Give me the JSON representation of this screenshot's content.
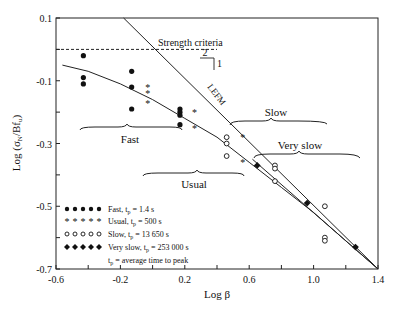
{
  "chart_data": {
    "type": "scatter",
    "title": "",
    "xlabel": "Log β",
    "ylabel": "Log (σN/Bfu)",
    "xlim": [
      -0.6,
      1.4
    ],
    "ylim": [
      -0.7,
      0.1
    ],
    "x_ticks": [
      -0.6,
      -0.2,
      0.2,
      0.6,
      1.0,
      1.4
    ],
    "x_tick_labels": [
      "-0.6",
      "-0.2",
      "0.2",
      "0.6",
      "1.0",
      "1.4"
    ],
    "x_minor_ticks": [
      -0.4,
      0.0,
      0.4,
      0.8,
      1.2
    ],
    "y_ticks": [
      0.1,
      -0.1,
      -0.3,
      -0.5,
      -0.7
    ],
    "y_tick_labels": [
      "0.1",
      "-0.1",
      "-0.3",
      "-0.5",
      "-0.7"
    ],
    "y_minor_ticks": [
      0.0,
      -0.2,
      -0.4,
      -0.6
    ],
    "grid": false,
    "legend_position": "lower left (inside)",
    "series": [
      {
        "name": "Fast, tp = 1.4 s",
        "marker": "filled-circle",
        "x": [
          -0.43,
          -0.43,
          -0.43,
          -0.13,
          -0.13,
          -0.13,
          0.17,
          0.17,
          0.17,
          0.17
        ],
        "y": [
          -0.02,
          -0.09,
          -0.11,
          -0.07,
          -0.12,
          -0.19,
          -0.19,
          -0.2,
          -0.21,
          -0.24
        ]
      },
      {
        "name": "Usual, tp = 500 s",
        "marker": "asterisk",
        "x": [
          -0.03,
          -0.03,
          -0.03,
          0.26,
          0.26,
          0.56,
          0.56
        ],
        "y": [
          -0.12,
          -0.14,
          -0.17,
          -0.2,
          -0.25,
          -0.28,
          -0.36
        ]
      },
      {
        "name": "Slow, tp = 13 650 s",
        "marker": "open-circle",
        "x": [
          0.46,
          0.46,
          0.46,
          0.76,
          0.76,
          0.76,
          1.07,
          1.07,
          1.07
        ],
        "y": [
          -0.28,
          -0.3,
          -0.34,
          -0.37,
          -0.38,
          -0.42,
          -0.5,
          -0.6,
          -0.61
        ]
      },
      {
        "name": "Very slow, tp = 253 000 s",
        "marker": "filled-diamond",
        "x": [
          0.65,
          0.96,
          1.26
        ],
        "y": [
          -0.37,
          -0.49,
          -0.63
        ]
      }
    ],
    "lines": [
      {
        "name": "Strength criteria",
        "style": "dashed",
        "x": [
          -0.6,
          0.4
        ],
        "y": [
          0.0,
          0.0
        ]
      },
      {
        "name": "LEFM",
        "style": "solid",
        "x": [
          -0.18,
          1.4
        ],
        "y": [
          0.1,
          -0.7
        ],
        "slope_annotation": {
          "run": "2",
          "rise": "1"
        }
      },
      {
        "name": "size effect law fit",
        "style": "solid curve",
        "x": [
          -0.56,
          -0.4,
          -0.2,
          0.0,
          0.2,
          0.4,
          0.6,
          0.8,
          1.0,
          1.2,
          1.4
        ],
        "y": [
          -0.05,
          -0.07,
          -0.11,
          -0.16,
          -0.22,
          -0.28,
          -0.36,
          -0.44,
          -0.52,
          -0.61,
          -0.7
        ]
      }
    ],
    "annotations": [
      "Strength criteria",
      "LEFM",
      "2",
      "1",
      "Fast",
      "Usual",
      "Slow",
      "Very slow"
    ],
    "legend_note": "tp = average time to peak"
  },
  "labels": {
    "xlabel": "Log β",
    "ylabel_prefix": "Log (σ",
    "ylabel_sub1": "N",
    "ylabel_mid": "/Bf",
    "ylabel_sub2": "u",
    "ylabel_suffix": ")",
    "strength": "Strength criteria",
    "lefm": "LEFM",
    "slope_run": "2",
    "slope_rise": "1",
    "fast": "Fast",
    "usual": "Usual",
    "slow": "Slow",
    "very_slow": "Very slow"
  },
  "legend": [
    {
      "label": "Fast, t",
      "sub": "p",
      "rest": " = 1.4 s"
    },
    {
      "label": "Usual, t",
      "sub": "p",
      "rest": " = 500 s"
    },
    {
      "label": "Slow, t",
      "sub": "p",
      "rest": " = 13 650 s"
    },
    {
      "label": "Very slow, t",
      "sub": "p",
      "rest": " = 253 000 s"
    },
    {
      "label": "t",
      "sub": "p",
      "rest": " = average time to peak"
    }
  ]
}
